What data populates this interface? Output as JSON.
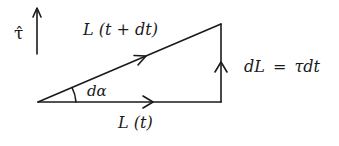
{
  "diagram": {
    "type": "vector-triangle",
    "labels": {
      "tau_hat": "τ̂",
      "L_t_plus_dt": "L (t + dt)",
      "L_t": "L (t)",
      "d_alpha": "dα",
      "dL_eq": "dL = τdt"
    },
    "stroke_color": "#1a1a1a",
    "vectors": [
      {
        "name": "L(t)",
        "from": [
          38,
          102
        ],
        "to": [
          221,
          102
        ]
      },
      {
        "name": "L(t+dt)",
        "from": [
          38,
          102
        ],
        "to": [
          221,
          24
        ]
      },
      {
        "name": "dL",
        "from": [
          221,
          102
        ],
        "to": [
          221,
          24
        ]
      },
      {
        "name": "tau-hat",
        "from": [
          37,
          54
        ],
        "to": [
          37,
          8
        ]
      }
    ]
  }
}
